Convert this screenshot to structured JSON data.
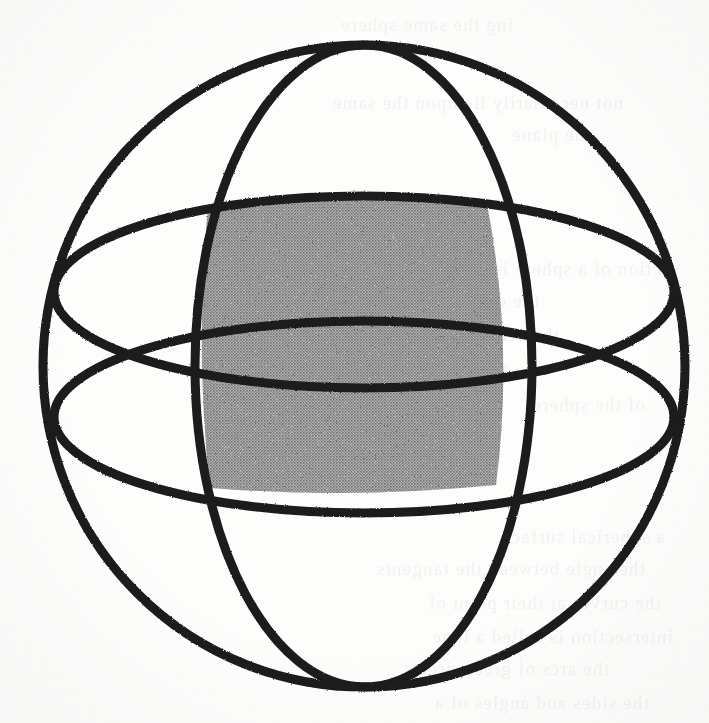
{
  "figure": {
    "caption": "",
    "background_color": "#fdfdfc",
    "stroke_color": "#1a1a1a",
    "shade_color": "#9a9a9a",
    "canvas": {
      "width": 709,
      "height": 723
    },
    "sphere": {
      "name": "sphere-outline",
      "center_x": 364,
      "center_y": 366,
      "radius": 321,
      "stroke_width": 9
    },
    "poles": {
      "north_label": "",
      "north_x": 365,
      "north_y": 45,
      "south_label": "",
      "south_x": 365,
      "south_y": 687
    },
    "meridians": [
      {
        "name": "meridian-left",
        "semi_x": 152,
        "semi_y": 321,
        "center_x": 347,
        "center_y": 366,
        "stroke_width": 9
      },
      {
        "name": "meridian-right",
        "semi_x": 150,
        "semi_y": 321,
        "center_x": 382,
        "center_y": 366,
        "stroke_width": 9
      }
    ],
    "latitudes": [
      {
        "name": "latitude-upper",
        "semi_x": 310,
        "semi_y": 96,
        "center_x": 364,
        "center_y": 292,
        "stroke_width": 9
      },
      {
        "name": "latitude-lower",
        "semi_x": 310,
        "semi_y": 96,
        "center_x": 364,
        "center_y": 417,
        "stroke_width": 9
      }
    ],
    "shaded_region": {
      "name": "shaded-spherical-quadrilateral",
      "fill": "#9a9a9a",
      "corners": [
        {
          "label": "top-left",
          "x": 208,
          "y": 207
        },
        {
          "label": "top-right",
          "x": 487,
          "y": 204
        },
        {
          "label": "bottom-right",
          "x": 496,
          "y": 485
        },
        {
          "label": "bottom-left",
          "x": 210,
          "y": 488
        }
      ],
      "top_apex_y": 196,
      "bottom_apex_y": 496,
      "left_apex_x": 198,
      "right_apex_x": 508
    },
    "bleed_through_lines": [
      {
        "x": 196,
        "y": 8,
        "text": "ing the same sphere"
      },
      {
        "x": 86,
        "y": 86,
        "text": "not necessarily lie upon the same"
      },
      {
        "x": 118,
        "y": 118,
        "text": "the plane"
      },
      {
        "x": 30,
        "y": 252,
        "text": "section of a sphere is"
      },
      {
        "x": 170,
        "y": 284,
        "text": "the circle is called"
      },
      {
        "x": 150,
        "y": 318,
        "text": "the centre and"
      },
      {
        "x": 192,
        "y": 356,
        "text": "circles of a sphere"
      },
      {
        "x": 64,
        "y": 388,
        "text": "of the sphere"
      },
      {
        "x": 44,
        "y": 520,
        "text": "a spherical surface"
      },
      {
        "x": 64,
        "y": 552,
        "text": "the angle between the tangents"
      },
      {
        "x": 48,
        "y": 586,
        "text": "the curves at their point of"
      },
      {
        "x": 36,
        "y": 620,
        "text": "intersection is called a lune"
      },
      {
        "x": 100,
        "y": 652,
        "text": "the arcs of great circles"
      },
      {
        "x": 60,
        "y": 686,
        "text": "the sides and angles of a"
      }
    ]
  }
}
